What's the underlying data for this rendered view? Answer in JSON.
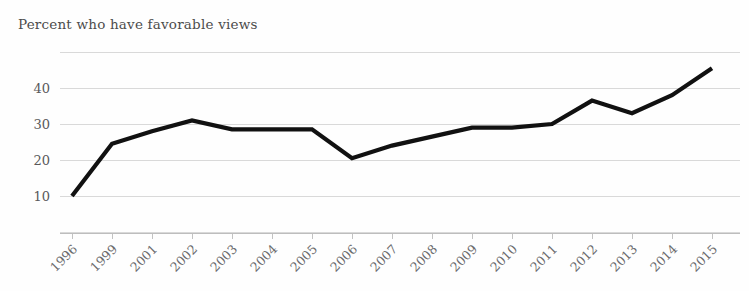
{
  "chart_data": {
    "type": "line",
    "title": "Percent who have favorable views",
    "subtitle": "",
    "xlabel": "",
    "ylabel": "",
    "categories": [
      "1996",
      "1999",
      "2001",
      "2002",
      "2003",
      "2004",
      "2005",
      "2006",
      "2007",
      "2008",
      "2009",
      "2010",
      "2011",
      "2012",
      "2013",
      "2014",
      "2015"
    ],
    "values": [
      10,
      24.5,
      28,
      31,
      28.5,
      28.5,
      28.5,
      20.5,
      24,
      26.5,
      29,
      29,
      30,
      36.5,
      33,
      38,
      45.5
    ],
    "series": [
      {
        "name": "Favorable views",
        "color": "#111111",
        "values": [
          10,
          24.5,
          28,
          31,
          28.5,
          28.5,
          28.5,
          20.5,
          24,
          26.5,
          29,
          29,
          30,
          36.5,
          33,
          38,
          45.5
        ]
      }
    ],
    "ylim": [
      0,
      50
    ],
    "ytick_labels": [
      "10",
      "20",
      "30",
      "40"
    ],
    "ytick_values": [
      10,
      20,
      30,
      40
    ],
    "gridline_values": [
      0,
      10,
      20,
      30,
      40,
      50
    ],
    "grid": true,
    "legend": false,
    "legend_position": "none",
    "xtick_rotation": -45,
    "annotations": []
  },
  "colors": {
    "line": "#111111",
    "grid": "#d9d9d9",
    "axis": "#bdbdbd",
    "title_text": "#4c4c4c",
    "tick_text": "#59595b",
    "background": "#fefefe"
  }
}
